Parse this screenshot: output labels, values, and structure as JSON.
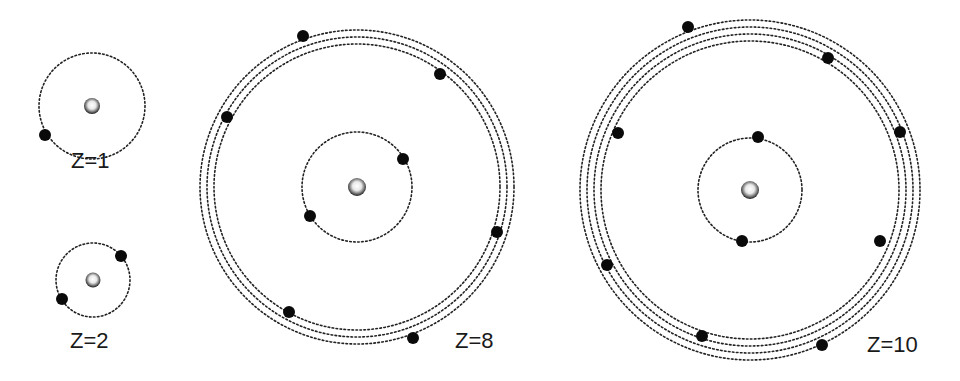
{
  "diagram": {
    "title": "",
    "colors": {
      "background": "#ffffff",
      "orbit": "#222222",
      "electron": "#0a0a0a",
      "nucleus_center": "#ffffff",
      "nucleus_edge": "#1a1a1a"
    },
    "atoms": [
      {
        "id": "z1",
        "label": "Z=1",
        "label_pos": [
          71,
          150
        ],
        "center": [
          92,
          106
        ],
        "nucleus_r": 8,
        "orbits": [
          53
        ],
        "electrons": [
          [
            45,
            135
          ]
        ]
      },
      {
        "id": "z2",
        "label": "Z=2",
        "label_pos": [
          70,
          330
        ],
        "center": [
          93,
          280
        ],
        "nucleus_r": 7.5,
        "orbits": [
          37
        ],
        "electrons": [
          [
            121,
            256
          ],
          [
            62,
            299
          ]
        ]
      },
      {
        "id": "z8",
        "label": "Z=8",
        "label_pos": [
          455,
          330
        ],
        "center": [
          357,
          187
        ],
        "nucleus_r": 9,
        "orbits": [
          55,
          143,
          150,
          157
        ],
        "electrons": [
          [
            303,
            36
          ],
          [
            440,
            74
          ],
          [
            227,
            117
          ],
          [
            403,
            159
          ],
          [
            310,
            216
          ],
          [
            497,
            232
          ],
          [
            289,
            312
          ],
          [
            413,
            338
          ]
        ]
      },
      {
        "id": "z10",
        "label": "Z=10",
        "label_pos": [
          867,
          334
        ],
        "center": [
          750,
          190
        ],
        "nucleus_r": 9,
        "orbits": [
          52,
          149,
          156,
          163,
          170
        ],
        "electrons": [
          [
            688,
            27
          ],
          [
            828,
            58
          ],
          [
            618,
            133
          ],
          [
            900,
            132
          ],
          [
            758,
            137
          ],
          [
            742,
            241
          ],
          [
            880,
            241
          ],
          [
            607,
            265
          ],
          [
            702,
            336
          ],
          [
            822,
            345
          ]
        ]
      }
    ]
  }
}
